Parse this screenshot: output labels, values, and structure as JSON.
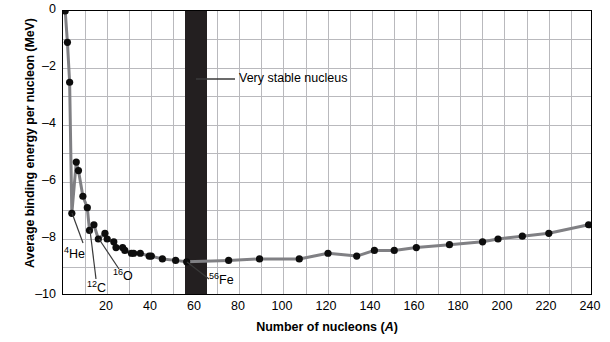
{
  "chart_data": {
    "type": "scatter",
    "title": "",
    "xlabel": "Number of nucleons (A)",
    "ylabel": "Average binding energy per nucleon (MeV)",
    "xlim": [
      0,
      240
    ],
    "ylim": [
      -10,
      0
    ],
    "xticks": [
      20,
      40,
      60,
      80,
      100,
      120,
      140,
      160,
      180,
      200,
      220,
      240
    ],
    "yticks": [
      "0",
      "–2",
      "–4",
      "–6",
      "–8",
      "–10"
    ],
    "ytick_values": [
      0,
      -2,
      -4,
      -6,
      -8,
      -10
    ],
    "grid": true,
    "grid_x_step": 10,
    "grid_y_step": 1,
    "legend": "none",
    "series": [
      {
        "name": "Average binding energy per nucleon",
        "x": [
          1,
          2,
          3,
          4,
          6,
          7,
          9,
          11,
          12,
          14,
          16,
          19,
          20,
          23,
          24,
          27,
          28,
          31,
          32,
          35,
          39,
          40,
          45,
          51,
          56,
          75,
          89,
          107,
          120,
          133,
          141,
          150,
          160,
          175,
          190,
          197,
          208,
          220,
          238
        ],
        "y": [
          0.0,
          -1.1,
          -2.5,
          -7.1,
          -5.3,
          -5.6,
          -6.5,
          -6.9,
          -7.7,
          -7.5,
          -8.0,
          -7.8,
          -8.0,
          -8.1,
          -8.3,
          -8.3,
          -8.4,
          -8.5,
          -8.5,
          -8.5,
          -8.6,
          -8.6,
          -8.7,
          -8.75,
          -8.8,
          -8.75,
          -8.7,
          -8.7,
          -8.5,
          -8.6,
          -8.4,
          -8.4,
          -8.3,
          -8.2,
          -8.1,
          -8.0,
          -7.9,
          -7.8,
          -7.5
        ]
      }
    ],
    "annotations": [
      {
        "label": "Very stable nucleus",
        "target_x": 60,
        "target_y": -2.4
      },
      {
        "label": "4He",
        "element": "He",
        "mass_number": "4",
        "target_x": 4,
        "target_y": -7.1
      },
      {
        "label": "12C",
        "element": "C",
        "mass_number": "12",
        "target_x": 12,
        "target_y": -7.7
      },
      {
        "label": "16O",
        "element": "O",
        "mass_number": "16",
        "target_x": 16,
        "target_y": -8.0
      },
      {
        "label": "56Fe",
        "element": "Fe",
        "mass_number": "56",
        "target_x": 56,
        "target_y": -8.8
      }
    ],
    "stable_band": {
      "x_start": 55,
      "x_end": 65,
      "color": "#231f20"
    }
  },
  "colors": {
    "curve": "#808084",
    "point": "#0d0d0d",
    "grid": "#b9b9bd",
    "frame": "#000000",
    "band": "#231f20",
    "text": "#000000",
    "background": "#ffffff"
  },
  "axis": {
    "y_title": "Average binding energy per nucleon (MeV)",
    "x_title_prefix": "Number of nucleons (",
    "x_title_italic": "A",
    "x_title_suffix": ")"
  },
  "labels": {
    "very_stable": "Very stable nucleus",
    "he4_sup": "4",
    "he4_base": "He",
    "c12_sup": "12",
    "c12_base": "C",
    "o16_sup": "16",
    "o16_base": "O",
    "fe56_sup": "56",
    "fe56_base": "Fe"
  }
}
